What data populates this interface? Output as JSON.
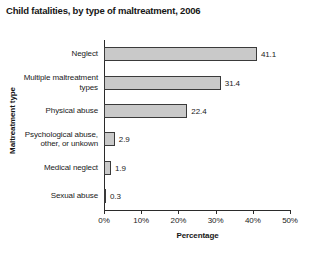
{
  "chart_data": {
    "type": "bar",
    "orientation": "horizontal",
    "title": "Child fatalities, by type of maltreatment, 2006",
    "xlabel": "Percentage",
    "ylabel": "Maltreatment type",
    "categories": [
      "Neglect",
      "Multiple maltreatment types",
      "Physical abuse",
      "Psychological abuse, other, or unkown",
      "Medical neglect",
      "Sexual abuse"
    ],
    "values": [
      41.1,
      31.4,
      22.4,
      2.9,
      1.9,
      0.3
    ],
    "value_labels": [
      "41.1",
      "31.4",
      "22.4",
      "2.9",
      "1.9",
      "0.3"
    ],
    "xlim": [
      0,
      50
    ],
    "xticks": [
      0,
      10,
      20,
      30,
      40,
      50
    ],
    "xtick_labels": [
      "0%",
      "10%",
      "20%",
      "30%",
      "40%",
      "50%"
    ],
    "grid": false,
    "legend": false,
    "bar_fill_color": "#c9c9c9",
    "bar_border_color": "#3a3a3a",
    "axis_color": "#2b2b2b",
    "background_color": "#ffffff"
  }
}
